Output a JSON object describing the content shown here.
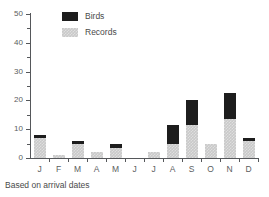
{
  "caption": "Based on arrival dates",
  "legend": {
    "position": "top-left-inside",
    "entries": [
      {
        "label": "Birds",
        "color": "#1d1d1d",
        "swatch": "birds"
      },
      {
        "label": "Records",
        "color": "#c9c9c9",
        "swatch": "records"
      }
    ]
  },
  "axis": {
    "y_ticks_major": [
      0,
      10,
      20,
      30,
      40,
      50
    ],
    "y_ticks_minor": [
      5,
      15,
      25,
      35,
      45
    ],
    "x_labels": [
      "J",
      "F",
      "M",
      "A",
      "M",
      "J",
      "J",
      "A",
      "S",
      "O",
      "N",
      "D"
    ]
  },
  "chart_data": {
    "type": "bar",
    "stacked": true,
    "title": "",
    "subtitle": "",
    "xlabel": "",
    "ylabel": "",
    "ylim": [
      0,
      50
    ],
    "xlim_categories": 12,
    "grid": false,
    "legend_position": "top-left-inside",
    "annotations": [
      "Based on arrival dates"
    ],
    "categories": [
      "J",
      "F",
      "M",
      "A",
      "M",
      "J",
      "J",
      "A",
      "S",
      "O",
      "N",
      "D"
    ],
    "category_names": [
      "January",
      "February",
      "March",
      "April",
      "May",
      "June",
      "July",
      "August",
      "September",
      "October",
      "November",
      "December"
    ],
    "series": [
      {
        "name": "Records",
        "color": "#c9c9c9",
        "values": [
          7,
          1,
          5,
          2,
          3.5,
          0,
          2,
          5,
          11.5,
          5,
          13.5,
          6
        ]
      },
      {
        "name": "Birds",
        "color": "#1d1d1d",
        "values": [
          1,
          0,
          1,
          0,
          1.5,
          0,
          0,
          6.5,
          8.5,
          0,
          9,
          1
        ]
      }
    ],
    "totals": [
      8,
      1,
      6,
      2,
      5,
      0,
      2,
      11.5,
      20,
      5,
      22.5,
      7
    ]
  }
}
